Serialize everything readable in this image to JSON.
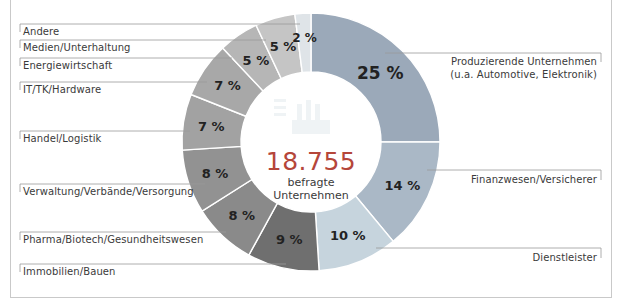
{
  "chart_data": {
    "type": "pie",
    "variant": "donut",
    "title": "",
    "center": {
      "value": "18.755",
      "label_line1": "befragte",
      "label_line2": "Unternehmen",
      "value_color": "#b5463a"
    },
    "categories": [
      "Produzierende Unternehmen (u.a. Automotive, Elektronik)",
      "Finanzwesen/Versicherer",
      "Dienstleister",
      "Immobilien/Bauen",
      "Pharma/Biotech/Gesundheitswesen",
      "Verwaltung/Verbände/Versorgung",
      "Handel/Logistik",
      "IT/TK/Hardware",
      "Energiewirtschaft",
      "Medien/Unterhaltung",
      "Andere"
    ],
    "values": [
      25,
      14,
      10,
      9,
      8,
      8,
      7,
      7,
      5,
      5,
      2
    ],
    "unit": "%",
    "value_labels": [
      "25 %",
      "14 %",
      "10 %",
      "9 %",
      "8 %",
      "8 %",
      "7 %",
      "7 %",
      "5 %",
      "5 %",
      "2 %"
    ],
    "colors": [
      "#9ba9b9",
      "#aab8c6",
      "#c6d4dd",
      "#6f6f6f",
      "#8a8a8a",
      "#929292",
      "#a2a2a2",
      "#a8a8a8",
      "#b6b6b6",
      "#c5c5c5",
      "#dfe4e8"
    ],
    "start_angle": "12 o'clock",
    "direction": "clockwise",
    "legend_position": "leader-line labels around donut"
  },
  "labels": {
    "produzierende_line1": "Produzierende Unternehmen",
    "produzierende_line2": "(u.a. Automotive, Elektronik)",
    "finanz": "Finanzwesen/Versicherer",
    "dienstleister": "Dienstleister",
    "immobilien": "Immobilien/Bauen",
    "pharma": "Pharma/Biotech/Gesundheitswesen",
    "verwaltung": "Verwaltung/Verbände/Versorgung",
    "handel": "Handel/Logistik",
    "it": "IT/TK/Hardware",
    "energie": "Energiewirtschaft",
    "medien": "Medien/Unterhaltung",
    "andere": "Andere"
  },
  "icons": {
    "center_watermark": "factory-icon"
  }
}
